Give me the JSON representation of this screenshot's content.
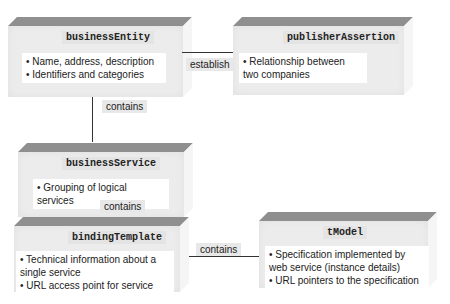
{
  "diagram": {
    "nodes": [
      {
        "id": "businessEntity",
        "title": "businessEntity",
        "items": [
          "• Name, address, description",
          "• Identifiers and categories"
        ]
      },
      {
        "id": "publisherAssertion",
        "title": "publisherAssertion",
        "items": [
          "• Relationship between two companies"
        ]
      },
      {
        "id": "businessService",
        "title": "businessService",
        "items": [
          "• Grouping of logical services"
        ]
      },
      {
        "id": "bindingTemplate",
        "title": "bindingTemplate",
        "items": [
          "• Technical information about a single service",
          "• URL access point for service"
        ]
      },
      {
        "id": "tModel",
        "title": "tModel",
        "items": [
          "• Specification implemented by web service (instance details)",
          "• URL pointers to the specification"
        ]
      }
    ],
    "edges": [
      {
        "from": "businessEntity",
        "to": "publisherAssertion",
        "label": "establish"
      },
      {
        "from": "businessEntity",
        "to": "businessService",
        "label": "contains"
      },
      {
        "from": "businessService",
        "to": "bindingTemplate",
        "label": "contains"
      },
      {
        "from": "bindingTemplate",
        "to": "tModel",
        "label": "contains"
      }
    ]
  }
}
